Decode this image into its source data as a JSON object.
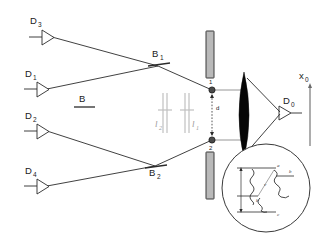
{
  "figure": {
    "type": "optics-schematic",
    "title": "",
    "background_color": "#ffffff",
    "accent_color": "#2b2b2b",
    "gray_color": "#9a9a9a"
  },
  "detectors": [
    {
      "id": "D3",
      "label": "D",
      "sub": "3",
      "x": 30,
      "y": 22
    },
    {
      "id": "D1",
      "label": "D",
      "sub": "1",
      "x": 25,
      "y": 75
    },
    {
      "id": "D2",
      "label": "D",
      "sub": "2",
      "x": 25,
      "y": 113
    },
    {
      "id": "D4",
      "label": "D",
      "sub": "4",
      "x": 25,
      "y": 168
    },
    {
      "id": "D0",
      "label": "D",
      "sub": "0",
      "x": 288,
      "y": 101
    }
  ],
  "beamsplitters": [
    {
      "id": "B",
      "label": "B",
      "sub": "",
      "x": 84,
      "y": 100
    },
    {
      "id": "B1",
      "label": "B",
      "sub": "1",
      "x": 158,
      "y": 55
    },
    {
      "id": "B2",
      "label": "B",
      "sub": "2",
      "x": 155,
      "y": 158
    }
  ],
  "path_markers": [
    {
      "id": "l2",
      "label": "l",
      "sub": "2",
      "x": 158,
      "y": 122
    },
    {
      "id": "l1",
      "label": "l",
      "sub": "1",
      "x": 193,
      "y": 122
    }
  ],
  "slits": [
    {
      "id": "slit1",
      "label": "1",
      "x": 212,
      "y": 82
    },
    {
      "id": "slit2",
      "label": "2",
      "x": 212,
      "y": 142
    }
  ],
  "separation": {
    "label": "d",
    "x": 216,
    "y": 107
  },
  "axis": {
    "label": "x",
    "sub": "0",
    "x": 305,
    "y": 80
  },
  "inset": {
    "name": "atomic-level-diagram",
    "levels": [
      {
        "id": "a",
        "label": "a"
      },
      {
        "id": "b",
        "label": "b"
      },
      {
        "id": "c",
        "label": "c"
      },
      {
        "id": "bprime",
        "label": "b"
      }
    ],
    "transition_label": "ν"
  }
}
